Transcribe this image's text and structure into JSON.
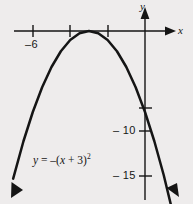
{
  "figure": {
    "background_color": "#eeecec",
    "ink_color": "#151515",
    "width": 193,
    "height": 204
  },
  "axes": {
    "x_label": "x",
    "y_label": "y",
    "x_axis_y_px": 31,
    "y_axis_x_px": 145,
    "x_unit_px": 18.7,
    "y_unit_px": 9.0
  },
  "ticks": {
    "x": [
      {
        "value": -6,
        "label": "–6",
        "x_px": 33,
        "labeled": true
      },
      {
        "value": -4,
        "label": "",
        "x_px": 70,
        "labeled": false
      },
      {
        "value": -2,
        "label": "",
        "x_px": 108,
        "labeled": false
      }
    ],
    "y": [
      {
        "value": -5,
        "label": "",
        "y_px": 108,
        "labeled": false
      },
      {
        "value": -10,
        "label": "– 10",
        "y_px": 131,
        "labeled": true
      },
      {
        "value": -15,
        "label": "– 15",
        "y_px": 176,
        "labeled": true
      }
    ]
  },
  "equation": {
    "lhs": "y",
    "eq": " = ",
    "rhs_prefix": "–(",
    "var": "x",
    "rhs_mid": " + 3)",
    "exponent": "2",
    "plain_text": "y = –(x + 3)²"
  },
  "chart_data": {
    "type": "line",
    "title": "",
    "xlabel": "x",
    "ylabel": "y",
    "function": "y = -(x + 3)^2",
    "vertex": [
      -3,
      0
    ],
    "opens": "down",
    "xlim": [
      -7.05,
      1.6
    ],
    "ylim": [
      -19.2,
      1.5
    ],
    "grid": false,
    "legend": "none",
    "x": [
      -7.05,
      -6.5,
      -6,
      -5.5,
      -5,
      -4.5,
      -4,
      -3.5,
      -3,
      -2.5,
      -2,
      -1.5,
      -1,
      -0.5,
      0,
      0.5,
      1,
      1.6
    ],
    "y": [
      -16.4,
      -12.25,
      -9,
      -6.25,
      -4,
      -2.25,
      -1,
      -0.25,
      0,
      -0.25,
      -1,
      -2.25,
      -4,
      -6.25,
      -9,
      -12.25,
      -16,
      -21.16
    ],
    "arrowheads": [
      "start",
      "end"
    ],
    "annotations": [
      {
        "text": "y = –(x + 3)²",
        "x_px": 33,
        "y_px": 152
      }
    ]
  }
}
